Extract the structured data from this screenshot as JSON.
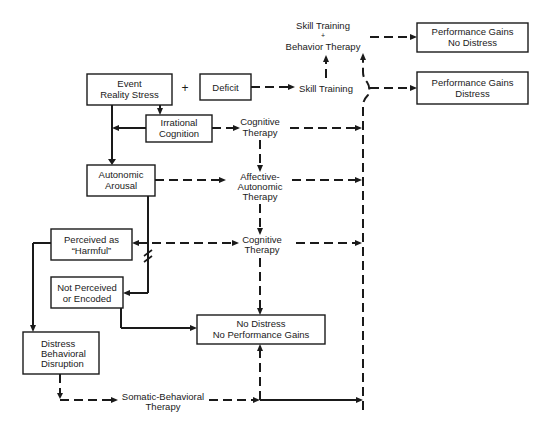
{
  "diagram": {
    "type": "flowchart",
    "nodes": {
      "event": {
        "lines": [
          "Event",
          "Reality Stress"
        ]
      },
      "plus": {
        "label": "+"
      },
      "deficit": {
        "lines": [
          "Deficit"
        ]
      },
      "irrational": {
        "lines": [
          "Irrational",
          "Cognition"
        ]
      },
      "autonomic": {
        "lines": [
          "Autonomic",
          "Arousal"
        ]
      },
      "perceived": {
        "lines": [
          "Perceived as",
          "“Harmful”"
        ]
      },
      "not_perceived": {
        "lines": [
          "Not Perceived",
          "or Encoded"
        ]
      },
      "distress_disruption": {
        "lines": [
          "Distress",
          "Behavioral",
          "Disruption"
        ]
      },
      "no_distress": {
        "lines": [
          "No Distress",
          "No Performance Gains"
        ]
      },
      "perf_no_distress": {
        "lines": [
          "Performance Gains",
          "No Distress"
        ]
      },
      "perf_distress": {
        "lines": [
          "Performance Gains",
          "Distress"
        ]
      }
    },
    "therapies": {
      "skill_behavior": {
        "lines": [
          "Skill Training",
          "+",
          "Behavior Therapy"
        ]
      },
      "skill": {
        "lines": [
          "Skill Training"
        ]
      },
      "cognitive_1": {
        "lines": [
          "Cognitive",
          "Therapy"
        ]
      },
      "affective": {
        "lines": [
          "Affective-",
          "Autonomic",
          "Therapy"
        ]
      },
      "cognitive_2": {
        "lines": [
          "Cognitive",
          "Therapy"
        ]
      },
      "somatic": {
        "lines": [
          "Somatic-Behavioral",
          "Therapy"
        ]
      }
    },
    "legend_hint": {
      "solid_lines": "natural course",
      "dashed_lines": "therapeutic path"
    }
  }
}
